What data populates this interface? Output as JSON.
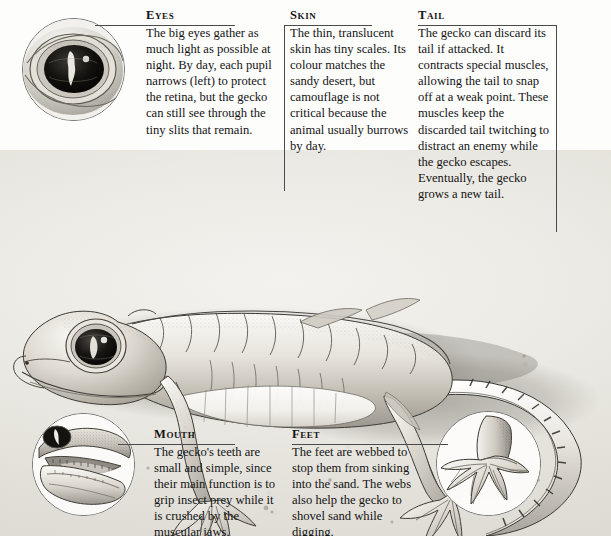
{
  "page": {
    "background_color": "#eceae4",
    "rule_color": "#4a4a4a",
    "text_color": "#141414"
  },
  "callouts": [
    {
      "id": "eyes",
      "heading": "Eyes",
      "body": "The big eyes gather as much light as possible at night. By day, each pupil narrows (left) to protect the retina, but the gecko can still see through the tiny slits that remain."
    },
    {
      "id": "skin",
      "heading": "Skin",
      "body": "The thin, translucent skin has tiny scales. Its colour matches the sandy desert, but camouflage is not critical because the animal usually burrows by day."
    },
    {
      "id": "tail",
      "heading": "Tail",
      "body": "The gecko can discard its tail if attacked. It contracts special muscles, allowing the tail to snap off at a weak point. These muscles keep the discarded tail twitching to distract an enemy while the gecko escapes. Eventually, the gecko grows a new tail."
    },
    {
      "id": "mouth",
      "heading": "Mouth",
      "body": "The gecko's teeth are small and simple, since their main function is to grip insect prey while it is crushed by the muscular jaws."
    },
    {
      "id": "feet",
      "heading": "Feet",
      "body": "The feet are webbed to stop them from sinking into the sand. The webs also help the gecko to shovel sand while digging."
    }
  ],
  "insets": [
    {
      "id": "eye-detail",
      "name": "gecko-eye-closeup"
    },
    {
      "id": "mouth-detail",
      "name": "gecko-open-mouth-closeup"
    },
    {
      "id": "foot-detail",
      "name": "gecko-webbed-foot-closeup"
    }
  ],
  "illustration": {
    "name": "web-footed-gecko-full-body",
    "caption_overlap": "a new tail."
  }
}
